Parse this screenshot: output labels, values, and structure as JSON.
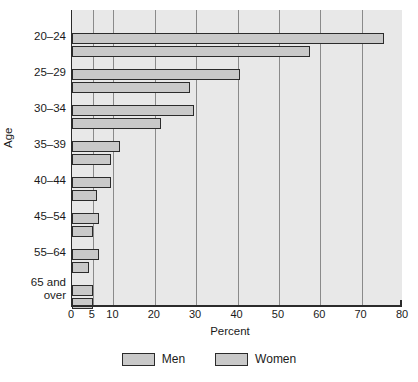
{
  "chart_data": {
    "type": "bar",
    "orientation": "horizontal",
    "title": "",
    "xlabel": "Percent",
    "ylabel": "Age",
    "xlim": [
      0,
      80
    ],
    "xticks": [
      0,
      5,
      10,
      20,
      30,
      40,
      50,
      60,
      70,
      80
    ],
    "xtick_labels": [
      "0",
      "5",
      "10",
      "20",
      "30",
      "40",
      "50",
      "60",
      "70",
      "80"
    ],
    "grid": true,
    "grid_axis": "x",
    "legend_position": "bottom",
    "categories": [
      "20–24",
      "25–29",
      "30–34",
      "35–39",
      "40–44",
      "45–54",
      "55–64",
      "65 and\nover"
    ],
    "series": [
      {
        "name": "Men",
        "values": [
          75.5,
          40.5,
          29.5,
          11.5,
          9.5,
          6.5,
          6.5,
          5.0
        ]
      },
      {
        "name": "Women",
        "values": [
          57.5,
          28.5,
          21.5,
          9.5,
          6.0,
          5.0,
          4.0,
          5.0
        ]
      }
    ],
    "colors": {
      "bar_fill": "#c9c9c9",
      "bar_stroke": "#2b2b2b",
      "plot_background": "#e8e8e8",
      "gridline": "#8a8a8a",
      "text": "#1a1a1a"
    }
  },
  "legend": {
    "entries": [
      {
        "label": "Men"
      },
      {
        "label": "Women"
      }
    ]
  }
}
